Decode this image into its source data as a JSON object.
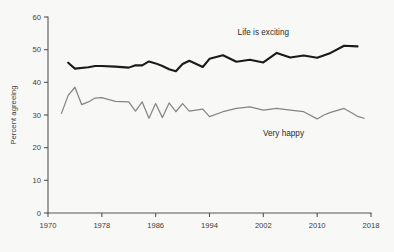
{
  "chart_data": {
    "type": "line",
    "title": "",
    "subtitle": "",
    "xlabel": "",
    "ylabel": "Percent agreeing",
    "xlim": [
      1970,
      2018
    ],
    "ylim": [
      0,
      60
    ],
    "grid": false,
    "legend_position": "inline-annotation",
    "xticks": [
      1970,
      1978,
      1986,
      1994,
      2002,
      2010,
      2018
    ],
    "xtick_labels": [
      "1970",
      "1978",
      "1986",
      "1994",
      "2002",
      "2010",
      "2018"
    ],
    "yticks": [
      0,
      10,
      20,
      30,
      40,
      50,
      60
    ],
    "ytick_labels": [
      "0",
      "10",
      "20",
      "30",
      "40",
      "50",
      "60"
    ],
    "series": [
      {
        "name": "Life is exciting",
        "color": "#1a1a1a",
        "stroke_width": 2.1,
        "label_x": 2002,
        "label_y": 54.5,
        "x": [
          1973,
          1974,
          1976,
          1977,
          1978,
          1980,
          1982,
          1983,
          1984,
          1985,
          1986,
          1987,
          1988,
          1989,
          1990,
          1991,
          1993,
          1994,
          1996,
          1998,
          2000,
          2002,
          2004,
          2006,
          2008,
          2010,
          2012,
          2014,
          2016
        ],
        "values": [
          46.0,
          44.2,
          44.6,
          45.0,
          45.0,
          44.8,
          44.5,
          45.2,
          45.2,
          46.4,
          45.8,
          45.0,
          44.0,
          43.4,
          45.6,
          46.6,
          44.7,
          47.2,
          48.3,
          46.3,
          46.9,
          46.1,
          49.0,
          47.6,
          48.2,
          47.5,
          49.0,
          51.2,
          51.0
        ]
      },
      {
        "name": "Very happy",
        "color": "#858585",
        "stroke_width": 1.25,
        "label_x": 2005,
        "label_y": 23.5,
        "x": [
          1972,
          1973,
          1974,
          1975,
          1976,
          1977,
          1978,
          1980,
          1982,
          1983,
          1984,
          1985,
          1986,
          1987,
          1988,
          1989,
          1990,
          1991,
          1993,
          1994,
          1996,
          1998,
          2000,
          2002,
          2004,
          2006,
          2008,
          2010,
          2011,
          2012,
          2014,
          2016,
          2017
        ],
        "values": [
          30.5,
          36.0,
          38.5,
          33.2,
          34.0,
          35.2,
          35.3,
          34.2,
          34.0,
          31.2,
          34.0,
          29.0,
          33.5,
          29.2,
          33.7,
          31.0,
          33.5,
          31.2,
          31.8,
          29.5,
          31.0,
          32.0,
          32.5,
          31.5,
          32.0,
          31.5,
          31.0,
          28.8,
          30.0,
          30.8,
          32.0,
          29.6,
          29.0
        ]
      }
    ]
  }
}
